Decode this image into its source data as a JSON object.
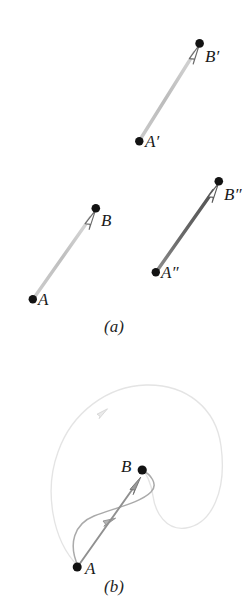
{
  "figure": {
    "background_color": "#ffffff",
    "panels": [
      {
        "id": "a",
        "caption": "(a)",
        "description": "three straight vector arrows AB, A'B', A''B''",
        "arrows": [
          {
            "name": "arrow-A-prime-B-prime",
            "tail_label": "A'",
            "head_label": "B'",
            "tail": {
              "x": 139,
              "y": 141
            },
            "head": {
              "x": 199,
              "y": 45
            },
            "color": "#b9b9b9",
            "shaft_width": 3.2
          },
          {
            "name": "arrow-A-B",
            "tail_label": "A",
            "head_label": "B",
            "tail": {
              "x": 33,
              "y": 299
            },
            "head": {
              "x": 95,
              "y": 210
            },
            "color": "#bdbdbd",
            "shaft_width": 3.2
          },
          {
            "name": "arrow-A-double-prime-B-double-prime",
            "tail_label": "A\"",
            "head_label": "B\"",
            "tail": {
              "x": 156,
              "y": 272
            },
            "head": {
              "x": 218,
              "y": 183
            },
            "color": "#6e6e6e",
            "shaft_width": 3.2
          }
        ],
        "point_color": "#111111",
        "point_radius": 4.2,
        "arrowhead_style": "open-triangle",
        "arrowhead_fill": "#ffffff",
        "arrowhead_stroke": "#5a5a5a"
      },
      {
        "id": "b",
        "caption": "(b)",
        "description": "point A and point B joined by a straight arrow, a curved arrow, and a large enclosing loop with an arrowhead",
        "points": [
          {
            "name": "point-A",
            "label": "A",
            "x": 77,
            "y": 567
          },
          {
            "name": "point-B",
            "label": "B",
            "x": 142,
            "y": 470
          }
        ],
        "paths": [
          {
            "name": "large-loop-path",
            "color": "#e2e2e2",
            "stroke_width": 1.3,
            "arrowhead_at": {
              "x": 103,
              "y": 412
            }
          },
          {
            "name": "curved-transport-path",
            "color": "#a6a6a6",
            "stroke_width": 1.5,
            "arrowhead_at": {
              "x": 109,
              "y": 521
            }
          },
          {
            "name": "straight-arrow-A-to-B",
            "color": "#8a8a8a",
            "stroke_width": 1.8,
            "arrowhead_at": {
              "x": 133,
              "y": 487
            }
          }
        ],
        "point_color": "#111111",
        "point_radius": 4.4
      }
    ]
  },
  "labels": {
    "b_prime": "B′",
    "a_prime": "A′",
    "b_plain": "B",
    "a_plain": "A",
    "b_double_prime": "B″",
    "a_double_prime": "A″",
    "b_panel_b": "B",
    "a_panel_b": "A",
    "caption_a": "(a)",
    "caption_b": "(b)"
  }
}
